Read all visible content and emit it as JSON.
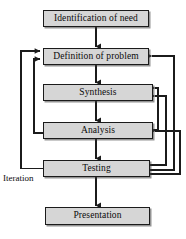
{
  "diagram": {
    "colors": {
      "box_fill": "#d6d6d6",
      "box_border": "#1b1b1b",
      "line": "#1b1b1b",
      "background": "#ffffff",
      "text": "#0a0a0a"
    },
    "stages": [
      {
        "id": "identification",
        "label": "Identification of need"
      },
      {
        "id": "definition",
        "label": "Definition of problem"
      },
      {
        "id": "synthesis",
        "label": "Synthesis"
      },
      {
        "id": "analysis",
        "label": "Analysis"
      },
      {
        "id": "testing",
        "label": "Testing"
      },
      {
        "id": "presentation",
        "label": "Presentation"
      }
    ],
    "annotations": [
      {
        "id": "iteration",
        "label": "Iteration"
      }
    ],
    "flow": {
      "forward": [
        "Identification of need -> Definition of problem",
        "Definition of problem -> Synthesis",
        "Synthesis -> Analysis",
        "Analysis -> Testing",
        "Testing -> Presentation"
      ],
      "feedback": [
        "Testing -> Definition of problem (outer left loop)",
        "Analysis -> Definition of problem (inner left loop)",
        "Testing -> Definition of problem (outer right loop)",
        "Testing -> Synthesis (right loop)",
        "Analysis -> Synthesis (right loop)",
        "Testing -> Analysis (right loop)"
      ]
    }
  }
}
